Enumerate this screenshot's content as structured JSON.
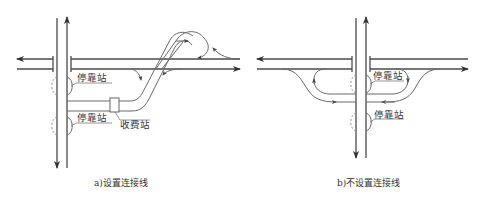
{
  "panels": [
    {
      "id": "a",
      "caption": "a)设置连接线",
      "labels": {
        "stop_upper": "停靠站",
        "stop_lower": "停靠站",
        "toll": "收费站"
      }
    },
    {
      "id": "b",
      "caption": "b)不设置连接线",
      "labels": {
        "stop_upper": "停靠站",
        "stop_lower": "停靠站"
      }
    }
  ],
  "colors": {
    "line": "#4a4a4a",
    "background": "#ffffff"
  }
}
